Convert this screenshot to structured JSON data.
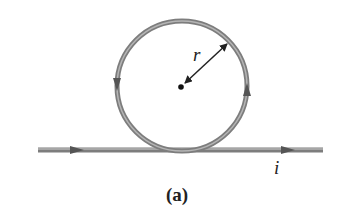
{
  "figure": {
    "caption": "(a)",
    "labels": {
      "radius": "r",
      "current": "i"
    },
    "colors": {
      "wire": "#7d7d7d",
      "wire_highlight": "#b5b5b5",
      "arrow": "#555555",
      "ink": "#222222"
    },
    "elements": {
      "loop": "circular-loop",
      "straight_wire": "straight-wire",
      "center_point": "center-dot",
      "radius_arrow": "double-headed-arrow"
    }
  }
}
